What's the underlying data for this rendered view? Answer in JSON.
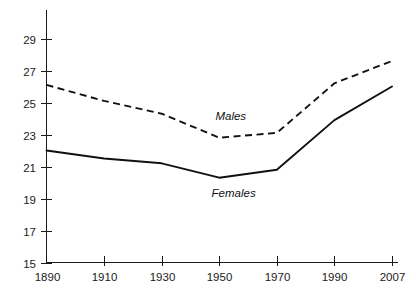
{
  "chart_data": {
    "type": "line",
    "title": "",
    "subtitle": "",
    "xlabel": "",
    "ylabel": "",
    "x": [
      1890,
      1910,
      1930,
      1950,
      1970,
      1990,
      2007
    ],
    "xtick_labels": [
      "1890",
      "1910",
      "1930",
      "1950",
      "1970",
      "1990",
      "2007"
    ],
    "ytick_labels": [
      "15",
      "17",
      "19",
      "21",
      "23",
      "25",
      "27",
      "29"
    ],
    "yticks": [
      15,
      17,
      19,
      21,
      23,
      25,
      27,
      29
    ],
    "ylim": [
      15,
      30
    ],
    "xlim": [
      1890,
      2007
    ],
    "grid": false,
    "legend_position": "inline-annotation",
    "series": [
      {
        "name": "Males",
        "style": "dashed",
        "color": "#111111",
        "values": [
          26.1,
          25.1,
          24.3,
          22.8,
          23.1,
          26.2,
          27.6
        ]
      },
      {
        "name": "Females",
        "style": "solid",
        "color": "#111111",
        "values": [
          22.0,
          21.5,
          21.2,
          20.3,
          20.8,
          23.9,
          26.0
        ]
      }
    ],
    "annotations": [
      {
        "text": "Males",
        "x": 1954,
        "y": 23.9
      },
      {
        "text": "Females",
        "x": 1955,
        "y": 19.1
      }
    ]
  }
}
